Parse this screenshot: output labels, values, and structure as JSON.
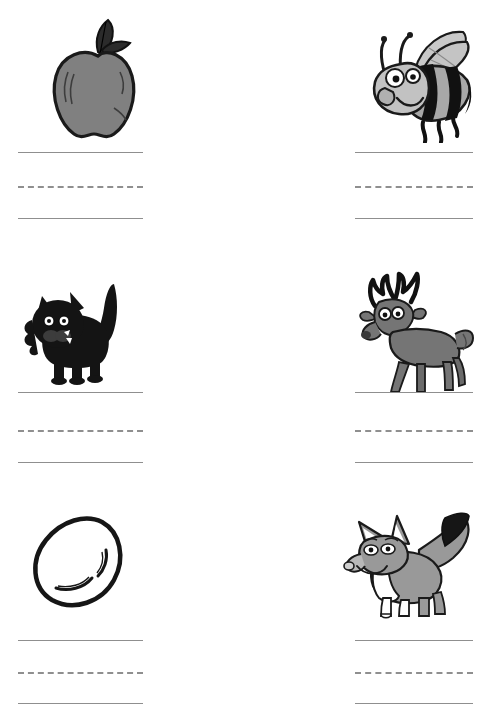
{
  "worksheet": {
    "title": "Beginning Sounds Handwriting Practice Worksheet",
    "type": "handwriting-practice",
    "page_width": 486,
    "page_height": 716,
    "background_color": "#ffffff",
    "columns": 2,
    "rows": 3,
    "line_style": {
      "top_line": "solid",
      "middle_line": "dashed",
      "bottom_line": "solid",
      "line_color": "#8f8f8f",
      "dash_count": 4
    },
    "palette": {
      "ink": "#1a1a1a",
      "mid_gray": "#808080",
      "light_gray": "#b5b5b5",
      "dark_gray": "#4a4a4a",
      "white": "#ffffff"
    }
  },
  "cells": [
    {
      "id": "cell-apple",
      "picture_name": "apple",
      "word": "apple",
      "initial_letter": "a",
      "column": "left",
      "row": 1,
      "colors": {
        "body": "#808080",
        "outline": "#1a1a1a",
        "leaf": "#2b2b2b"
      },
      "writing_lines": {
        "top": "solid",
        "middle": "dashed",
        "bottom": "solid"
      }
    },
    {
      "id": "cell-bee",
      "picture_name": "bee",
      "word": "bee",
      "initial_letter": "b",
      "column": "right",
      "row": 1,
      "colors": {
        "body": "#a8a8a8",
        "stripes": "#111111",
        "wings": "#c9c9c9",
        "outline": "#1a1a1a"
      },
      "writing_lines": {
        "top": "solid",
        "middle": "dashed",
        "bottom": "solid"
      }
    },
    {
      "id": "cell-cat",
      "picture_name": "cat",
      "word": "cat",
      "initial_letter": "c",
      "column": "left",
      "row": 2,
      "colors": {
        "body": "#141414",
        "eyes": "#ffffff",
        "muzzle": "#ffffff",
        "outline": "#000000"
      },
      "writing_lines": {
        "top": "solid",
        "middle": "dashed",
        "bottom": "solid"
      }
    },
    {
      "id": "cell-deer",
      "picture_name": "deer",
      "word": "deer",
      "initial_letter": "d",
      "column": "right",
      "row": 2,
      "colors": {
        "body": "#757575",
        "antlers": "#111111",
        "eyes": "#ffffff",
        "outline": "#1a1a1a"
      },
      "writing_lines": {
        "top": "solid",
        "middle": "dashed",
        "bottom": "solid"
      }
    },
    {
      "id": "cell-egg",
      "picture_name": "egg",
      "word": "egg",
      "initial_letter": "e",
      "column": "left",
      "row": 3,
      "colors": {
        "body": "#ffffff",
        "outline": "#161616",
        "shine": "#161616"
      },
      "writing_lines": {
        "top": "solid",
        "middle": "dashed",
        "bottom": "solid"
      }
    },
    {
      "id": "cell-fox",
      "picture_name": "fox",
      "word": "fox",
      "initial_letter": "f",
      "column": "right",
      "row": 3,
      "colors": {
        "body": "#999999",
        "chest": "#ffffff",
        "tail_tip": "#161616",
        "outline": "#1a1a1a"
      },
      "writing_lines": {
        "top": "solid",
        "middle": "dashed",
        "bottom": "solid"
      }
    }
  ]
}
